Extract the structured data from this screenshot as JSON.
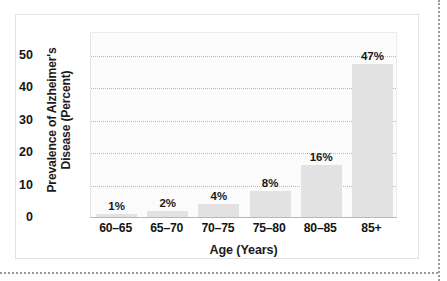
{
  "figure": {
    "border_color": "#e3e3e3",
    "background": "#ffffff"
  },
  "chart_data": {
    "type": "bar",
    "title": "",
    "subtitle": "",
    "xlabel": "Age (Years)",
    "ylabel": "Prevalence of Alzheimer's Disease (Percent)",
    "ylabel_line1": "Prevalence of Alzheimer's",
    "ylabel_line2": "Disease (Percent)",
    "categories": [
      "60–65",
      "65–70",
      "70–75",
      "75–80",
      "80–85",
      "85+"
    ],
    "values": [
      1,
      2,
      4,
      8,
      16,
      47
    ],
    "value_labels": [
      "1%",
      "2%",
      "4%",
      "8%",
      "16%",
      "47%"
    ],
    "ylim": [
      0,
      57
    ],
    "yticks": [
      0,
      10,
      20,
      30,
      40,
      50
    ],
    "ytick_labels": [
      "0",
      "10",
      "20",
      "30",
      "40",
      "50"
    ],
    "grid": "horizontal-dotted",
    "legend": "none",
    "bar_color": "#e2e2e2",
    "gridline_color": "#b9b9b9",
    "axis_color": "#b8b8b8",
    "text_color": "#141414"
  }
}
